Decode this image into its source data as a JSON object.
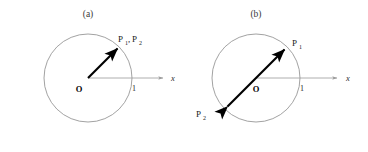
{
  "figure": {
    "background_color": "#ffffff",
    "circle_stroke_color": "#8a8a8a",
    "axis_stroke_color": "#9a9a9a",
    "vector_stroke_color": "#000000",
    "text_color": "#1a1a1a"
  },
  "panels": [
    {
      "id": "panel-a",
      "caption": "(a)",
      "origin_label": "O",
      "tick_label": "1",
      "axis_label": "x",
      "vector_kind": "single-headed-radius",
      "point_labels": [
        {
          "base": "P",
          "sub": "1"
        },
        {
          "base": "P",
          "sub": "2"
        }
      ],
      "point_label_text": "P₁, P₂",
      "label_separator": ",",
      "geometry": {
        "center_x": 88,
        "center_y": 78,
        "radius": 44,
        "axis_start_x": 88,
        "axis_end_x": 168,
        "axis_y": 78,
        "vector_tip_x": 119,
        "vector_tip_y": 47,
        "tick_x": 132
      }
    },
    {
      "id": "panel-b",
      "caption": "(b)",
      "origin_label": "O",
      "tick_label": "1",
      "axis_label": "x",
      "vector_kind": "double-headed-diameter",
      "point_labels": [
        {
          "base": "P",
          "sub": "1"
        },
        {
          "base": "P",
          "sub": "2"
        }
      ],
      "point_label_p1": "P₁",
      "point_label_p2": "P₂",
      "geometry": {
        "center_x": 72,
        "center_y": 78,
        "radius": 44,
        "axis_start_x": 72,
        "axis_end_x": 158,
        "axis_y": 78,
        "vector_tip_x": 103,
        "vector_tip_y": 47,
        "vector_tail_x": 41,
        "vector_tail_y": 109,
        "tick_x": 116
      }
    }
  ]
}
